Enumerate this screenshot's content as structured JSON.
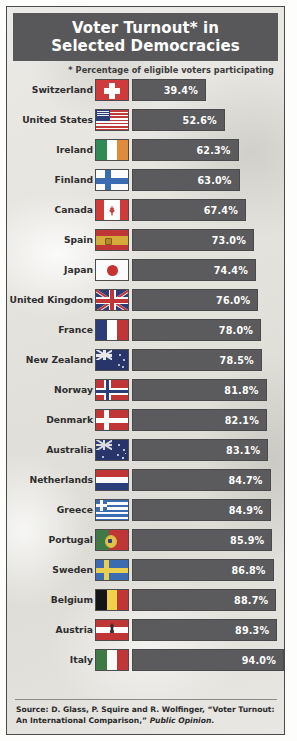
{
  "header": {
    "title_line1": "Voter Turnout* in",
    "title_line2": "Selected Democracies",
    "bg_color": "#58585a"
  },
  "subtitle": "* Percentage of eligible voters participating",
  "source": {
    "prefix": "Source: D. Glass, P. Squire and R. Wolfinger, “Voter Turnout: An International Comparison,” ",
    "italic": "Public Opinion",
    "suffix": "."
  },
  "colors": {
    "bar": "#5b5b5d",
    "header": "#58585a",
    "paper": "#e6e5e1",
    "border": "#4a4a4c",
    "value_text": "#ffffff",
    "label_text": "#2e2e2e"
  },
  "chart_data": {
    "type": "bar",
    "title": "Voter Turnout* in Selected Democracies",
    "subtitle": "* Percentage of eligible voters participating",
    "orientation": "horizontal",
    "xlabel": "",
    "ylabel": "",
    "unit": "%",
    "value_suffix": "%",
    "sorted": "ascending",
    "xlim": [
      0,
      100
    ],
    "grid": false,
    "legend": false,
    "categories": [
      "Switzerland",
      "United States",
      "Ireland",
      "Finland",
      "Canada",
      "Spain",
      "Japan",
      "United Kingdom",
      "France",
      "New Zealand",
      "Norway",
      "Denmark",
      "Australia",
      "Netherlands",
      "Greece",
      "Portugal",
      "Sweden",
      "Belgium",
      "Austria",
      "Italy"
    ],
    "values": [
      39.4,
      52.6,
      62.3,
      63.0,
      67.4,
      73.0,
      74.4,
      76.0,
      78.0,
      78.5,
      81.8,
      82.1,
      83.1,
      84.7,
      84.9,
      85.9,
      86.8,
      88.7,
      89.3,
      94.0
    ],
    "value_labels": [
      "39.4%",
      "52.6%",
      "62.3%",
      "63.0%",
      "67.4%",
      "73.0%",
      "74.4%",
      "76.0%",
      "78.0%",
      "78.5%",
      "81.8%",
      "82.1%",
      "83.1%",
      "84.7%",
      "84.9%",
      "85.9%",
      "86.8%",
      "88.7%",
      "89.3%",
      "94.0%"
    ],
    "source": "D. Glass, P. Squire and R. Wolfinger, “Voter Turnout: An International Comparison,” Public Opinion."
  },
  "rows": [
    {
      "country": "Switzerland",
      "value": 39.4,
      "label": "39.4%",
      "flag": "f-ch",
      "flag_name": "flag-switzerland"
    },
    {
      "country": "United States",
      "value": 52.6,
      "label": "52.6%",
      "flag": "f-us",
      "flag_name": "flag-united-states"
    },
    {
      "country": "Ireland",
      "value": 62.3,
      "label": "62.3%",
      "flag": "f-ie",
      "flag_name": "flag-ireland"
    },
    {
      "country": "Finland",
      "value": 63.0,
      "label": "63.0%",
      "flag": "f-fi",
      "flag_name": "flag-finland"
    },
    {
      "country": "Canada",
      "value": 67.4,
      "label": "67.4%",
      "flag": "f-ca",
      "flag_name": "flag-canada"
    },
    {
      "country": "Spain",
      "value": 73.0,
      "label": "73.0%",
      "flag": "f-es",
      "flag_name": "flag-spain"
    },
    {
      "country": "Japan",
      "value": 74.4,
      "label": "74.4%",
      "flag": "f-jp",
      "flag_name": "flag-japan"
    },
    {
      "country": "United Kingdom",
      "value": 76.0,
      "label": "76.0%",
      "flag": "f-uk",
      "flag_name": "flag-united-kingdom"
    },
    {
      "country": "France",
      "value": 78.0,
      "label": "78.0%",
      "flag": "f-fr",
      "flag_name": "flag-france"
    },
    {
      "country": "New Zealand",
      "value": 78.5,
      "label": "78.5%",
      "flag": "f-nz",
      "flag_name": "flag-new-zealand"
    },
    {
      "country": "Norway",
      "value": 81.8,
      "label": "81.8%",
      "flag": "f-no",
      "flag_name": "flag-norway"
    },
    {
      "country": "Denmark",
      "value": 82.1,
      "label": "82.1%",
      "flag": "f-dk",
      "flag_name": "flag-denmark"
    },
    {
      "country": "Australia",
      "value": 83.1,
      "label": "83.1%",
      "flag": "f-au",
      "flag_name": "flag-australia"
    },
    {
      "country": "Netherlands",
      "value": 84.7,
      "label": "84.7%",
      "flag": "f-nl",
      "flag_name": "flag-netherlands"
    },
    {
      "country": "Greece",
      "value": 84.9,
      "label": "84.9%",
      "flag": "f-gr",
      "flag_name": "flag-greece"
    },
    {
      "country": "Portugal",
      "value": 85.9,
      "label": "85.9%",
      "flag": "f-pt",
      "flag_name": "flag-portugal"
    },
    {
      "country": "Sweden",
      "value": 86.8,
      "label": "86.8%",
      "flag": "f-se",
      "flag_name": "flag-sweden"
    },
    {
      "country": "Belgium",
      "value": 88.7,
      "label": "88.7%",
      "flag": "f-be",
      "flag_name": "flag-belgium"
    },
    {
      "country": "Austria",
      "value": 89.3,
      "label": "89.3%",
      "flag": "f-at",
      "flag_name": "flag-austria"
    },
    {
      "country": "Italy",
      "value": 94.0,
      "label": "94.0%",
      "flag": "f-it",
      "flag_name": "flag-italy"
    }
  ]
}
